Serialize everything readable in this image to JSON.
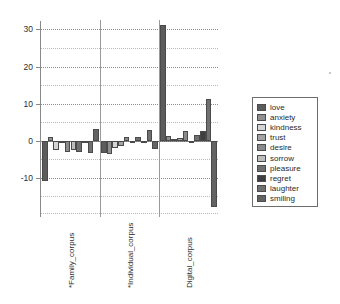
{
  "chart_data": {
    "type": "bar",
    "title": "",
    "subtitle": "",
    "xlabel": "",
    "ylabel": "",
    "ylim": [
      -20,
      32
    ],
    "yticks": [
      30,
      20,
      10,
      0,
      -10
    ],
    "minor_gridlines": [
      25,
      15,
      5,
      -5,
      -15
    ],
    "grid": true,
    "legend_position": "right",
    "categories": [
      "*Family_corpus",
      "*Individual_corpus",
      "Digital_corpus"
    ],
    "series": [
      {
        "name": "love",
        "color": "#5c5c5c",
        "values": [
          -11.0,
          -3.2,
          31.2
        ]
      },
      {
        "name": "anxiety",
        "color": "#8f8f8f",
        "values": [
          1.0,
          -3.6,
          1.2
        ]
      },
      {
        "name": "kindness",
        "color": "#d4d4d4",
        "values": [
          -2.6,
          -1.9,
          0.4
        ]
      },
      {
        "name": "trust",
        "color": "#a3a3a3",
        "values": [
          -0.6,
          -1.5,
          0.8
        ]
      },
      {
        "name": "desire",
        "color": "#8a8a8a",
        "values": [
          -3.1,
          0.9,
          2.5
        ]
      },
      {
        "name": "sorrow",
        "color": "#bdbdbd",
        "values": [
          -2.6,
          -0.4,
          -0.6
        ]
      },
      {
        "name": "pleasure",
        "color": "#6f6f6f",
        "values": [
          -3.0,
          1.1,
          1.5
        ]
      },
      {
        "name": "regret",
        "color": "#3f3f3f",
        "values": [
          -0.3,
          -0.5,
          2.6
        ]
      },
      {
        "name": "laughter",
        "color": "#707070",
        "values": [
          -3.3,
          3.0,
          11.3
        ]
      },
      {
        "name": "smiling",
        "color": "#636363",
        "values": [
          3.1,
          -2.3,
          -18.0
        ]
      }
    ]
  },
  "legend": {
    "items": [
      {
        "label": "love"
      },
      {
        "label": "anxiety"
      },
      {
        "label": "kindness"
      },
      {
        "label": "trust"
      },
      {
        "label": "desire"
      },
      {
        "label": "sorrow"
      },
      {
        "label": "pleasure"
      },
      {
        "label": "regret"
      },
      {
        "label": "laughter"
      },
      {
        "label": "smiling"
      }
    ]
  },
  "axis": {
    "tick_labels": [
      "30",
      "20",
      "10",
      "0",
      "-10"
    ]
  }
}
